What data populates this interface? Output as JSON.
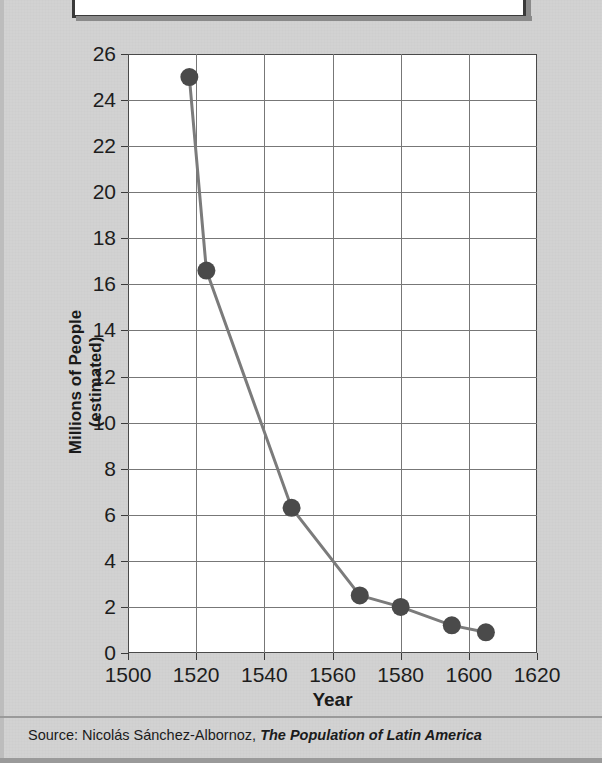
{
  "title": {
    "line": "of Central Mexico",
    "note": "clipped-at-top"
  },
  "source": {
    "prefix": "Source: Nicolás Sánchez-Albornoz, ",
    "book": "The Population of Latin America"
  },
  "colors": {
    "page_background": "#d2d2d2",
    "plot_background": "#ffffff",
    "grid": "#777777",
    "axis": "#4a4a4a",
    "series_line": "#7b7b7b",
    "marker": "#4a4a4a",
    "text": "#1d1d1d"
  },
  "chart_data": {
    "type": "line",
    "title": "of Central Mexico",
    "xlabel": "Year",
    "ylabel": "Millions of People (estimated)",
    "ylabel_lines": [
      "Millions of People",
      "(estimated)"
    ],
    "xlim": [
      1500,
      1620
    ],
    "ylim": [
      0,
      26
    ],
    "xticks": [
      1500,
      1520,
      1540,
      1560,
      1580,
      1600,
      1620
    ],
    "yticks": [
      0,
      2,
      4,
      6,
      8,
      10,
      12,
      14,
      16,
      18,
      20,
      22,
      24,
      26
    ],
    "grid": true,
    "legend": false,
    "series": [
      {
        "name": "Population of Central Mexico",
        "x": [
          1518,
          1523,
          1548,
          1568,
          1580,
          1595,
          1605
        ],
        "values": [
          25.0,
          16.6,
          6.3,
          2.5,
          2.0,
          1.2,
          0.9
        ]
      }
    ]
  }
}
